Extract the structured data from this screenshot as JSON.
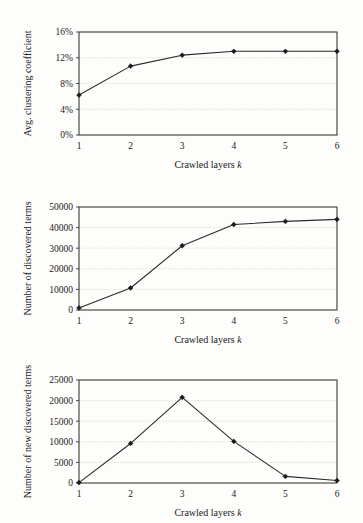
{
  "document": {
    "kind": "scanned-figure-page",
    "figure_count": 3,
    "background_color": "#fdfdfb",
    "ink_color": "#1a1a1a",
    "gridline_color": "#d9d6cf"
  },
  "shared": {
    "xlabel_text": "Crawled layers",
    "xlabel_symbol": "k",
    "x_ticks": [
      "1",
      "2",
      "3",
      "4",
      "5",
      "6"
    ]
  },
  "chart_data": [
    {
      "id": "avg-clustering-coefficient",
      "type": "line",
      "title": "",
      "xlabel": "Crawled layers k",
      "ylabel": "Avg. clustering coefficient",
      "x": [
        1,
        2,
        3,
        4,
        5,
        6
      ],
      "categories": [
        "1",
        "2",
        "3",
        "4",
        "5",
        "6"
      ],
      "values": [
        6.2,
        10.7,
        12.4,
        13.0,
        13.0,
        13.0
      ],
      "y_tick_labels": [
        "0%",
        "4%",
        "8%",
        "12%",
        "16%"
      ],
      "y_tick_values": [
        0,
        4,
        8,
        12,
        16
      ],
      "ylim": [
        0,
        16
      ],
      "xlim": [
        1,
        6
      ],
      "grid": true,
      "legend": null,
      "marker": "diamond",
      "series": [
        {
          "name": "Avg. clustering coefficient",
          "values": [
            6.2,
            10.7,
            12.4,
            13.0,
            13.0,
            13.0
          ]
        }
      ]
    },
    {
      "id": "number-of-discovered-terms",
      "type": "line",
      "title": "",
      "xlabel": "Crawled layers k",
      "ylabel": "Number of discovered terms",
      "x": [
        1,
        2,
        3,
        4,
        5,
        6
      ],
      "categories": [
        "1",
        "2",
        "3",
        "4",
        "5",
        "6"
      ],
      "values": [
        1000,
        10700,
        31200,
        41500,
        43000,
        44000
      ],
      "y_tick_labels": [
        "0",
        "10000",
        "20000",
        "30000",
        "40000",
        "50000"
      ],
      "y_tick_values": [
        0,
        10000,
        20000,
        30000,
        40000,
        50000
      ],
      "ylim": [
        0,
        50000
      ],
      "xlim": [
        1,
        6
      ],
      "grid": true,
      "legend": null,
      "marker": "diamond",
      "series": [
        {
          "name": "Number of discovered terms",
          "values": [
            1000,
            10700,
            31200,
            41500,
            43000,
            44000
          ]
        }
      ]
    },
    {
      "id": "number-of-new-discovered-terms",
      "type": "line",
      "title": "",
      "xlabel": "Crawled layers k",
      "ylabel": "Number of new discovered terms",
      "x": [
        1,
        2,
        3,
        4,
        5,
        6
      ],
      "categories": [
        "1",
        "2",
        "3",
        "4",
        "5",
        "6"
      ],
      "values": [
        100,
        9600,
        20800,
        10100,
        1600,
        600
      ],
      "y_tick_labels": [
        "0",
        "5000",
        "10000",
        "15000",
        "20000",
        "25000"
      ],
      "y_tick_values": [
        0,
        5000,
        10000,
        15000,
        20000,
        25000
      ],
      "ylim": [
        0,
        25000
      ],
      "xlim": [
        1,
        6
      ],
      "grid": true,
      "legend": null,
      "marker": "diamond",
      "series": [
        {
          "name": "Number of new discovered terms",
          "values": [
            100,
            9600,
            20800,
            10100,
            1600,
            600
          ]
        }
      ]
    }
  ]
}
